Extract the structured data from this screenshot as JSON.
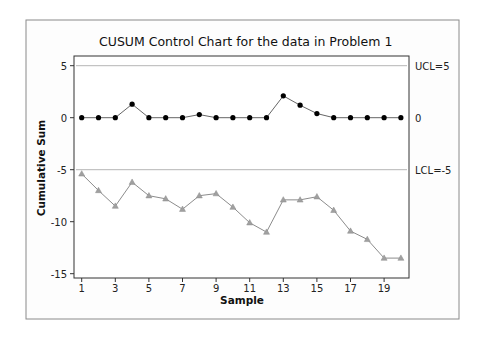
{
  "chart_data": {
    "type": "line",
    "title": "CUSUM Control Chart for the data in Problem 1",
    "xlabel": "Sample",
    "ylabel": "Cumulative Sum",
    "x": [
      1,
      2,
      3,
      4,
      5,
      6,
      7,
      8,
      9,
      10,
      11,
      12,
      13,
      14,
      15,
      16,
      17,
      18,
      19,
      20
    ],
    "x_ticks": [
      "1",
      "3",
      "5",
      "7",
      "9",
      "11",
      "13",
      "15",
      "17",
      "19"
    ],
    "y_ticks": [
      "5",
      "0",
      "-5",
      "-10",
      "-15"
    ],
    "ylim": [
      -15.5,
      6
    ],
    "xlim": [
      0.6,
      20.5
    ],
    "grid": false,
    "series": [
      {
        "name": "Upper CUSUM",
        "marker": "circle",
        "color": "#000000",
        "values": [
          0,
          0,
          0,
          1.3,
          0,
          0,
          0,
          0.3,
          0,
          0,
          0,
          0,
          2.1,
          1.2,
          0.4,
          0,
          0,
          0,
          0,
          0
        ]
      },
      {
        "name": "Lower CUSUM",
        "marker": "triangle",
        "color": "#8c8c8c",
        "values": [
          -5.4,
          -7.0,
          -8.5,
          -6.2,
          -7.5,
          -7.8,
          -8.8,
          -7.5,
          -7.3,
          -8.6,
          -10.1,
          -11.0,
          -7.9,
          -7.9,
          -7.6,
          -8.9,
          -10.9,
          -11.7,
          -13.5,
          -13.5
        ]
      }
    ],
    "reference_lines": [
      {
        "label": "UCL=5",
        "value": 5
      },
      {
        "label": "0",
        "value": 0
      },
      {
        "label": "LCL=-5",
        "value": -5
      }
    ]
  }
}
